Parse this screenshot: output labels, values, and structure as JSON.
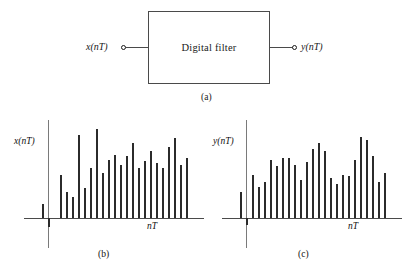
{
  "figure": {
    "title_caption_a": "(a)",
    "title_caption_b": "(b)",
    "title_caption_c": "(c)"
  },
  "block_diagram": {
    "box_label": "Digital filter",
    "input_label": "x(nT)",
    "output_label": "y(nT)",
    "input_terminal": "input-terminal-circle",
    "output_terminal": "output-terminal-circle",
    "caption": "(a)"
  },
  "chart_data": [
    {
      "type": "bar",
      "panel": "b",
      "title": "",
      "xlabel": "nT",
      "ylabel": "x(nT)",
      "grid": false,
      "legend": null,
      "ylim": [
        -0.12,
        1.0
      ],
      "xlim": [
        -2,
        27
      ],
      "x": [
        -2,
        -1,
        0,
        1,
        2,
        3,
        4,
        5,
        6,
        7,
        8,
        9,
        10,
        11,
        12,
        13,
        14,
        15,
        16,
        17,
        18,
        19,
        20,
        21,
        22,
        23,
        24
      ],
      "values": [
        0.0,
        0.15,
        -0.09,
        0.0,
        0.45,
        0.27,
        0.22,
        0.86,
        0.31,
        0.52,
        0.93,
        0.47,
        0.6,
        0.66,
        0.55,
        0.65,
        0.78,
        0.52,
        0.59,
        0.7,
        0.57,
        0.52,
        0.74,
        0.83,
        0.55,
        0.62,
        0.0
      ],
      "notes": "sampled input sequence, one short negative sample near origin"
    },
    {
      "type": "bar",
      "panel": "c",
      "title": "",
      "xlabel": "nT",
      "ylabel": "y(nT)",
      "grid": false,
      "legend": null,
      "ylim": [
        -0.12,
        1.0
      ],
      "xlim": [
        -2,
        27
      ],
      "x": [
        -2,
        -1,
        0,
        1,
        2,
        3,
        4,
        5,
        6,
        7,
        8,
        9,
        10,
        11,
        12,
        13,
        14,
        15,
        16,
        17,
        18,
        19,
        20,
        21,
        22,
        23,
        24
      ],
      "values": [
        0.0,
        0.27,
        -0.07,
        0.45,
        0.32,
        0.38,
        0.6,
        0.54,
        0.62,
        0.62,
        0.55,
        0.4,
        0.58,
        0.72,
        0.78,
        0.7,
        0.42,
        0.35,
        0.45,
        0.44,
        0.6,
        0.84,
        0.81,
        0.65,
        0.37,
        0.47,
        0.0
      ],
      "notes": "filtered output sequence, one short negative sample near origin"
    }
  ]
}
